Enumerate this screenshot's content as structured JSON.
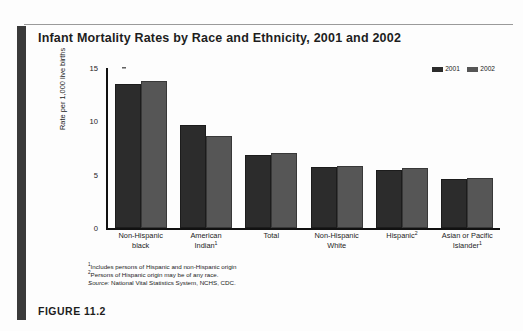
{
  "figure": {
    "caption": "FIGURE 11.2"
  },
  "chart_data": {
    "type": "bar",
    "title": "Infant Mortality Rates by Race and Ethnicity, 2001 and 2002",
    "xlabel": "",
    "ylabel": "Rate per 1,000 live births",
    "ylim": [
      0,
      15
    ],
    "yticks": [
      0,
      5,
      10,
      15
    ],
    "grid": false,
    "legend_position": "top-right",
    "categories": [
      "Non-Hispanic black",
      "American Indian",
      "Total",
      "Non-Hispanic White",
      "Hispanic",
      "Asian or Pacific Islander"
    ],
    "category_lines": [
      [
        "Non-Hispanic",
        "black"
      ],
      [
        "American",
        "Indian"
      ],
      [
        "Total",
        ""
      ],
      [
        "Non-Hispanic",
        "White"
      ],
      [
        "Hispanic",
        ""
      ],
      [
        "Asian or Pacific",
        "Islander"
      ]
    ],
    "category_footnote_marks": [
      "",
      "1",
      "",
      "",
      "2",
      "1"
    ],
    "series": [
      {
        "name": "2001",
        "color": "#2c2c2c",
        "values": [
          13.5,
          9.7,
          6.8,
          5.7,
          5.4,
          4.6
        ]
      },
      {
        "name": "2002",
        "color": "#565656",
        "values": [
          13.8,
          8.6,
          7.0,
          5.8,
          5.6,
          4.7
        ]
      }
    ]
  },
  "footnotes": [
    {
      "mark": "1",
      "text": "Includes persons of Hispanic and non-Hispanic origin"
    },
    {
      "mark": "2",
      "text": "Persons of Hispanic origin may be of any race."
    }
  ],
  "source": {
    "keyword": "Source:",
    "text": " National Vital Statistics System, NCHS, CDC."
  }
}
